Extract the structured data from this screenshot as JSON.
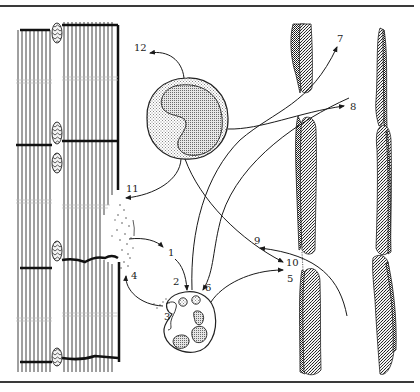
{
  "figure": {
    "type": "schematic illustration",
    "colors": {
      "line": "#1a1a1a",
      "stipple_light": "#d8d8d8",
      "stipple_dark": "#9a9a9a",
      "vessel_dark": "#3a3a3a",
      "background": "#ffffff"
    }
  },
  "labels": [
    {
      "id": "1",
      "text": "1"
    },
    {
      "id": "2",
      "text": "2"
    },
    {
      "id": "3",
      "text": "3"
    },
    {
      "id": "4",
      "text": "4"
    },
    {
      "id": "5",
      "text": "5"
    },
    {
      "id": "6",
      "text": "6"
    },
    {
      "id": "7",
      "text": "7"
    },
    {
      "id": "8",
      "text": "8"
    },
    {
      "id": "9",
      "text": "9"
    },
    {
      "id": "10",
      "text": "10"
    },
    {
      "id": "11",
      "text": "11"
    },
    {
      "id": "12",
      "text": "12"
    }
  ],
  "regions": {
    "muscle_fibers": "Striated muscle fibers with damaged region",
    "monocyte": "Large cell with kidney-shaped nucleus",
    "neutrophil": "Phagocytic cell with granules and lobed nucleus",
    "vessels": "Capillary/vessel walls with endothelial cells"
  }
}
